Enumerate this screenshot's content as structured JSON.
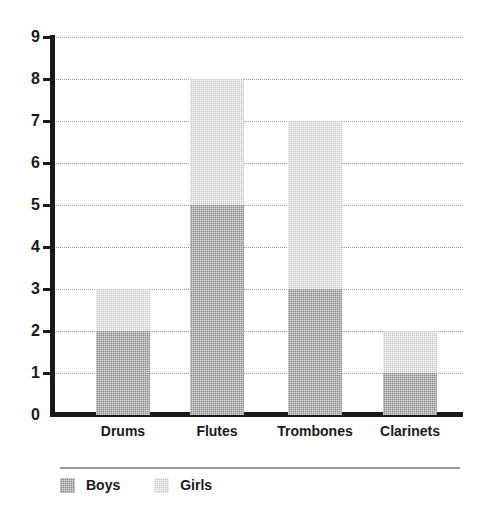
{
  "chart_data": {
    "type": "bar",
    "subtype": "stacked-vertical-bar",
    "title": "",
    "xlabel": "",
    "ylabel": "",
    "categories": [
      "Drums",
      "Flutes",
      "Trombones",
      "Clarinets"
    ],
    "series": [
      {
        "name": "Boys",
        "values": [
          2,
          5,
          3,
          1
        ],
        "color": "#8a8a8a"
      },
      {
        "name": "Girls",
        "values": [
          1,
          3,
          4,
          1
        ],
        "color": "#c9c9c9"
      }
    ],
    "totals": [
      3,
      8,
      7,
      2
    ],
    "ylim": [
      0,
      9
    ],
    "ytick_step": 1,
    "ytick_labels": [
      "0",
      "1",
      "2",
      "3",
      "4",
      "5",
      "6",
      "7",
      "8",
      "9"
    ],
    "grid": true,
    "grid_style": "dotted-horizontal",
    "grid_color": "#9a9a9a",
    "axis_color": "#1a1a1a",
    "legend_position": "bottom-left",
    "legend_entries": [
      "Boys",
      "Girls"
    ]
  },
  "axis": {
    "y_labels": [
      "9",
      "8",
      "7",
      "6",
      "5",
      "4",
      "3",
      "2",
      "1",
      "0"
    ]
  },
  "legend": {
    "items": [
      {
        "label": "Boys",
        "color": "#8a8a8a"
      },
      {
        "label": "Girls",
        "color": "#c9c9c9"
      }
    ]
  }
}
